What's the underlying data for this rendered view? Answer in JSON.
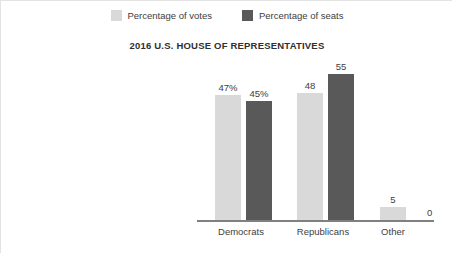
{
  "chart_data": {
    "type": "bar",
    "title": "2016 U.S. HOUSE OF REPRESENTATIVES",
    "xlabel": "",
    "ylabel": "",
    "grid": false,
    "legend_position": "top-center",
    "ylim": [
      0,
      60
    ],
    "categories": [
      "Democrats",
      "Republicans",
      "Other"
    ],
    "series": [
      {
        "name": "Percentage of votes",
        "color": "#d9d9d9",
        "values": [
          47,
          48,
          5
        ],
        "labels": [
          "47%",
          "48",
          "5"
        ]
      },
      {
        "name": "Percentage of seats",
        "color": "#595959",
        "values": [
          45,
          55,
          0
        ],
        "labels": [
          "45%",
          "55",
          "0"
        ]
      }
    ]
  },
  "legend": {
    "items": [
      {
        "label": "Percentage of votes",
        "color": "#d9d9d9"
      },
      {
        "label": "Percentage of seats",
        "color": "#595959"
      }
    ]
  },
  "axis": {
    "baseline_color": "#808080"
  },
  "colors": {
    "votes": "#d9d9d9",
    "seats": "#595959",
    "text": "#3d3d3d",
    "background": "#ffffff"
  }
}
